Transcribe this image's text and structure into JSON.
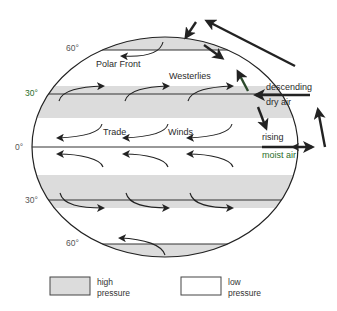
{
  "diagram": {
    "latitude_labels": {
      "n60": "60°",
      "n30": "30°",
      "eq": "0°",
      "s30": "30°",
      "s60": "60°"
    },
    "wind_labels": {
      "polar_front": "Polar Front",
      "westerlies": "Westerlies",
      "trade": "Trade",
      "winds": "Winds"
    },
    "side_labels": {
      "descending": "descending",
      "dry_air": "dry air",
      "rising": "rising",
      "moist_air": "moist air"
    },
    "legend": {
      "high_line1": "high",
      "high_line2": "pressure",
      "low_line1": "low",
      "low_line2": "pressure"
    },
    "colors": {
      "high_pressure_fill": "#dcdcdc",
      "low_pressure_fill": "#ffffff",
      "outline": "#222222",
      "label_green": "#2a6e2a"
    }
  }
}
